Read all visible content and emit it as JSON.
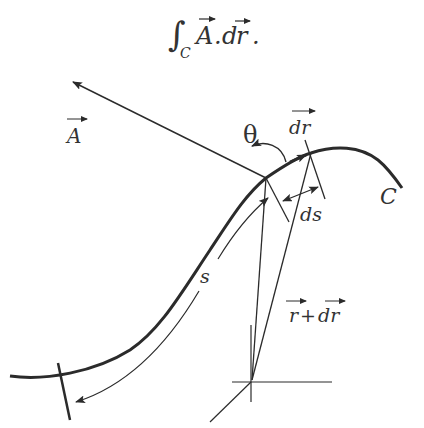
{
  "diagram": {
    "title": {
      "integral_sign": "∫",
      "subscript": "C",
      "field": "A",
      "dot": ".",
      "differential": "d",
      "position": "r",
      "period": "."
    },
    "labels": {
      "vector_A": "A",
      "theta": "θ",
      "dr": "dr",
      "curve": "C",
      "ds": "ds",
      "s": "s",
      "r_plus_dr_r": "r",
      "r_plus_dr_plus": "+",
      "r_plus_dr_dr": "dr"
    },
    "colors": {
      "stroke": "#2b2b2b",
      "text": "#333333",
      "background": "#ffffff"
    }
  }
}
